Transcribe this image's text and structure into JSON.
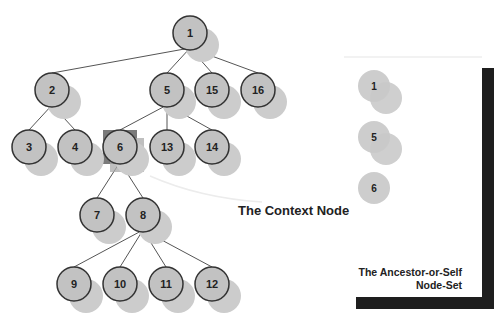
{
  "diagram": {
    "colors": {
      "node_fill": "#c2c2c2",
      "node_stroke": "#333333",
      "shadow": "#cccccc",
      "edge": "#555555",
      "highlight": "#7a7a7a",
      "bracket": "#1e1e1e",
      "text": "#222222"
    },
    "tree_nodes": [
      {
        "id": "1",
        "x": 190,
        "y": 33
      },
      {
        "id": "2",
        "x": 52,
        "y": 90
      },
      {
        "id": "5",
        "x": 167,
        "y": 90
      },
      {
        "id": "15",
        "x": 212,
        "y": 90
      },
      {
        "id": "16",
        "x": 258,
        "y": 90
      },
      {
        "id": "3",
        "x": 29,
        "y": 147
      },
      {
        "id": "4",
        "x": 75,
        "y": 147
      },
      {
        "id": "6",
        "x": 120,
        "y": 147
      },
      {
        "id": "13",
        "x": 167,
        "y": 147
      },
      {
        "id": "14",
        "x": 212,
        "y": 147
      },
      {
        "id": "7",
        "x": 97,
        "y": 215
      },
      {
        "id": "8",
        "x": 143,
        "y": 215
      },
      {
        "id": "9",
        "x": 74,
        "y": 284
      },
      {
        "id": "10",
        "x": 120,
        "y": 284
      },
      {
        "id": "11",
        "x": 166,
        "y": 284
      },
      {
        "id": "12",
        "x": 212,
        "y": 284
      }
    ],
    "edges": [
      [
        "1",
        "2"
      ],
      [
        "1",
        "5"
      ],
      [
        "1",
        "15"
      ],
      [
        "1",
        "16"
      ],
      [
        "2",
        "3"
      ],
      [
        "2",
        "4"
      ],
      [
        "5",
        "6"
      ],
      [
        "5",
        "13"
      ],
      [
        "5",
        "14"
      ],
      [
        "6",
        "7"
      ],
      [
        "6",
        "8"
      ],
      [
        "8",
        "9"
      ],
      [
        "8",
        "10"
      ],
      [
        "8",
        "11"
      ],
      [
        "8",
        "12"
      ]
    ],
    "context_node": {
      "id": "6",
      "label": "The Context Node"
    },
    "result_set": {
      "label_line1": "The Ancestor-or-Self",
      "label_line2": "Node-Set",
      "nodes": [
        {
          "id": "1",
          "x": 374,
          "y": 86
        },
        {
          "id": "5",
          "x": 374,
          "y": 137
        },
        {
          "id": "6",
          "x": 374,
          "y": 188
        }
      ]
    }
  }
}
